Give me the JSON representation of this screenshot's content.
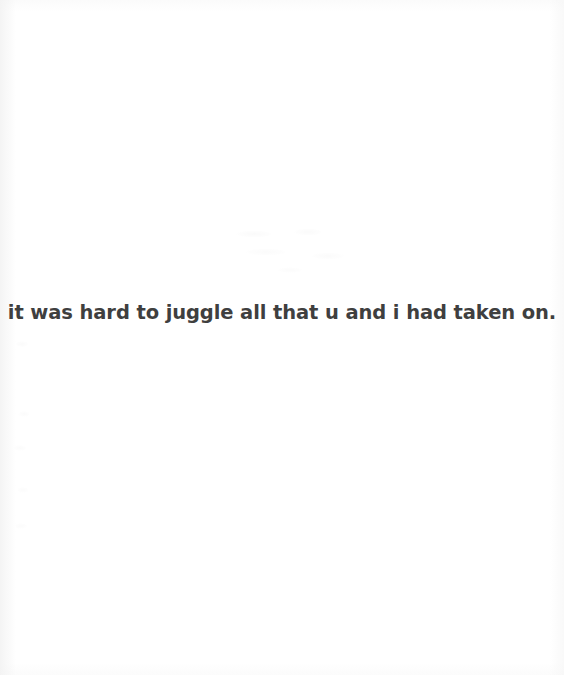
{
  "page": {
    "kind": "book-page-scan",
    "background_color": "#ffffff",
    "text_color": "#3f3f3f"
  },
  "body": {
    "poem_line": "it was hard to juggle all that u and i had taken on."
  }
}
